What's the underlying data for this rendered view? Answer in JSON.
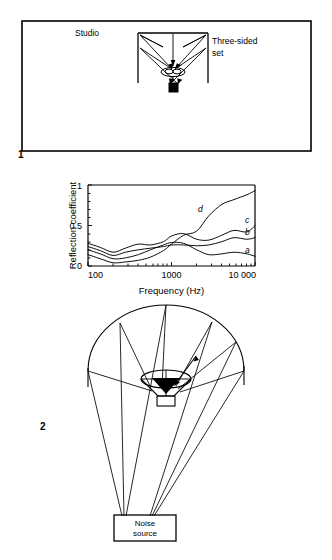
{
  "page": {
    "background_color": "#ffffff",
    "ink_color": "#000000",
    "width": 332,
    "height": 560
  },
  "figure1": {
    "number": "1",
    "caption_labels": {
      "studio": "Studio",
      "set_line1": "Three-sided",
      "set_line2": "set"
    },
    "description": "Plan view of a studio enclosure containing a three-sided set with a microphone and sound source, showing reflection ray paths"
  },
  "figure2": {
    "number": "2",
    "chart_data": {
      "type": "line",
      "title": "",
      "xlabel": "Frequency (Hz)",
      "ylabel": "Reflection coefficient",
      "xscale": "log",
      "xlim": [
        100,
        10000
      ],
      "ylim": [
        0,
        1
      ],
      "xticks": [
        100,
        1000,
        10000
      ],
      "xticklabels": [
        "100",
        "1000",
        "10 000"
      ],
      "yticks": [
        0,
        0.5,
        1
      ],
      "yticklabels": [
        "0",
        "0.5",
        "1"
      ],
      "grid": false,
      "legend": "inline-end-labels",
      "x": [
        100,
        140,
        200,
        280,
        400,
        560,
        800,
        1000,
        1400,
        2000,
        2800,
        4000,
        5600,
        8000,
        10000
      ],
      "series": [
        {
          "name": "a",
          "label": "a",
          "values": [
            0.2,
            0.15,
            0.09,
            0.1,
            0.14,
            0.2,
            0.26,
            0.29,
            0.28,
            0.2,
            0.14,
            0.15,
            0.17,
            0.15,
            0.12
          ]
        },
        {
          "name": "b",
          "label": "b",
          "values": [
            0.24,
            0.19,
            0.13,
            0.17,
            0.2,
            0.22,
            0.24,
            0.26,
            0.26,
            0.25,
            0.26,
            0.3,
            0.35,
            0.33,
            0.35
          ]
        },
        {
          "name": "c",
          "label": "c",
          "values": [
            0.28,
            0.23,
            0.17,
            0.22,
            0.27,
            0.26,
            0.3,
            0.37,
            0.4,
            0.33,
            0.32,
            0.38,
            0.44,
            0.42,
            0.5
          ]
        },
        {
          "name": "d",
          "label": "d",
          "values": [
            0.14,
            0.09,
            0.04,
            0.05,
            0.07,
            0.11,
            0.19,
            0.27,
            0.38,
            0.43,
            0.62,
            0.76,
            0.82,
            0.88,
            0.93
          ]
        }
      ]
    }
  },
  "figure3": {
    "number": "3",
    "labels": {
      "noise_source_line1": "Noise",
      "noise_source_line2": "source"
    },
    "description": "Elevation view of a hemispherical dome with rays converging from the dome surface down to a noise source box"
  }
}
